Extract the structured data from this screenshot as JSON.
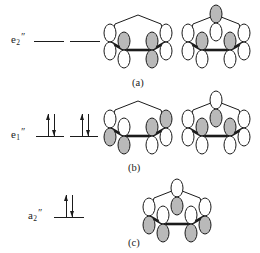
{
  "figure": {
    "ring_color": "#1b1b1b",
    "lobe_shaded_color": "#b9b9b9",
    "lobe_empty_color": "#ffffff",
    "line_color": "#1b1b1b"
  },
  "levels": [
    {
      "id": "e2",
      "label_base": "e",
      "label_sub": "2",
      "label_prime": "″",
      "label_text": "e2″",
      "electron_count": 0,
      "degeneracy": 2,
      "occupancy": [
        "",
        ""
      ]
    },
    {
      "id": "e1",
      "label_base": "e",
      "label_sub": "1",
      "label_prime": "″",
      "label_text": "e1″",
      "electron_count": 4,
      "degeneracy": 2,
      "occupancy": [
        "updown",
        "updown"
      ]
    },
    {
      "id": "a2",
      "label_base": "a",
      "label_sub": "2",
      "label_prime": "″",
      "label_text": "a2″",
      "electron_count": 2,
      "degeneracy": 1,
      "occupancy": [
        "updown"
      ]
    }
  ],
  "rows": [
    {
      "caption": "(a)",
      "level_id": "e2",
      "orbitals": [
        {
          "name": "e2-orbital-left",
          "nodes": 2,
          "phases": [
            "up-empty",
            "up-shaded",
            "up-empty",
            "up-shaded",
            "up-empty"
          ]
        },
        {
          "name": "e2-orbital-right",
          "nodes": 2,
          "phases": [
            "up-shaded",
            "up-empty",
            "up-shaded",
            "up-shaded",
            "up-empty"
          ]
        }
      ]
    },
    {
      "caption": "(b)",
      "level_id": "e1",
      "orbitals": [
        {
          "name": "e1-orbital-left",
          "nodes": 1,
          "phases": [
            "up-shaded",
            "up-empty",
            "up-shaded",
            "up-shaded",
            "up-empty"
          ]
        },
        {
          "name": "e1-orbital-right",
          "nodes": 1,
          "phases": [
            "up-empty",
            "up-shaded",
            "up-shaded",
            "up-shaded",
            "up-empty"
          ]
        }
      ]
    },
    {
      "caption": "(c)",
      "level_id": "a2",
      "orbitals": [
        {
          "name": "a2-orbital",
          "nodes": 0,
          "phases": [
            "up-shaded",
            "up-shaded",
            "up-shaded",
            "up-shaded",
            "up-shaded"
          ]
        }
      ]
    }
  ]
}
